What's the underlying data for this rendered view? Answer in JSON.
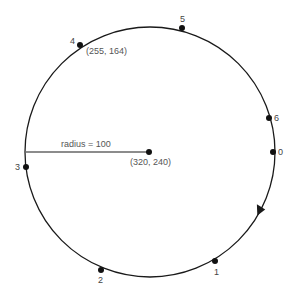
{
  "diagram": {
    "type": "circle-points",
    "stroke_color": "#1a1a1a",
    "label_color": "#555555",
    "circle": {
      "cx": 150,
      "cy": 152,
      "r": 125
    },
    "center": {
      "x": 149,
      "y": 152,
      "label": "(320, 240)"
    },
    "radius_line": {
      "x1": 26,
      "y1": 152,
      "x2": 149,
      "y2": 152,
      "label": "radius = 100"
    },
    "direction_arrow": {
      "x": 261,
      "y": 211,
      "direction": "clockwise"
    },
    "points": [
      {
        "id": "0",
        "label": "0",
        "x": 273,
        "y": 152,
        "lx": 278,
        "ly": 155
      },
      {
        "id": "1",
        "label": "1",
        "x": 215,
        "y": 261,
        "lx": 215,
        "ly": 273
      },
      {
        "id": "2",
        "label": "2",
        "x": 101,
        "y": 270,
        "lx": 98,
        "ly": 282
      },
      {
        "id": "3",
        "label": "3",
        "x": 26,
        "y": 167,
        "lx": 16,
        "ly": 170
      },
      {
        "id": "4",
        "label": "4",
        "x": 80,
        "y": 45,
        "lx": 71,
        "ly": 44,
        "coord_label": "(255, 164)",
        "cx": 87,
        "cy": 54
      },
      {
        "id": "5",
        "label": "5",
        "x": 182,
        "y": 28,
        "lx": 181,
        "ly": 22
      },
      {
        "id": "6",
        "label": "6",
        "x": 269,
        "y": 118,
        "lx": 274,
        "ly": 121
      }
    ]
  }
}
